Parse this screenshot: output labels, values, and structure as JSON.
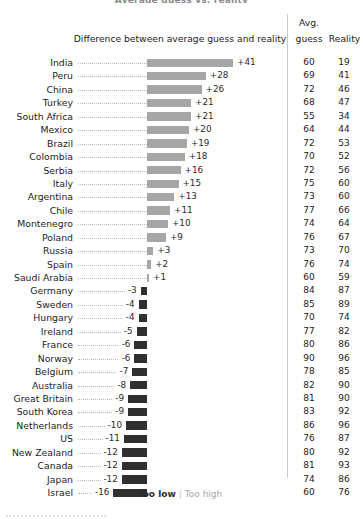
{
  "cropped_title": "Average guess vs. reality",
  "header": {
    "diff_label": "Difference between average guess and reality",
    "avg_line1": "Avg.",
    "avg_line2": "guess",
    "reality_label": "Reality"
  },
  "legend": {
    "too_low": "Too low",
    "separator": "|",
    "too_high": "Too high"
  },
  "colors": {
    "positive_bar": "#a6a6a6",
    "negative_bar": "#2f2f2f",
    "text": "#1c1c1c",
    "leader": "#b9b9b9",
    "divider": "#c9c9c9",
    "too_low": "#2b2b2b",
    "too_high": "#a8a8a8"
  },
  "chart_data": {
    "type": "bar",
    "orientation": "horizontal",
    "title": "Average guess vs. reality",
    "xlabel": "Difference between average guess and reality",
    "ylabel": "",
    "grid": false,
    "legend_position": "bottom",
    "zero_line": 0,
    "xlim": [
      -16,
      41
    ],
    "px_per_unit": 2.1,
    "categories": [
      "India",
      "Peru",
      "China",
      "Turkey",
      "South Africa",
      "Mexico",
      "Brazil",
      "Colombia",
      "Serbia",
      "Italy",
      "Argentina",
      "Chile",
      "Montenegro",
      "Poland",
      "Russia",
      "Spain",
      "Saudi Arabia",
      "Germany",
      "Sweden",
      "Hungary",
      "Ireland",
      "France",
      "Norway",
      "Belgium",
      "Australia",
      "Great Britain",
      "South Korea",
      "Netherlands",
      "US",
      "New Zealand",
      "Canada",
      "Japan",
      "Israel"
    ],
    "series": [
      {
        "name": "Difference between average guess and reality",
        "values": [
          41,
          28,
          26,
          21,
          21,
          20,
          19,
          18,
          16,
          15,
          13,
          11,
          10,
          9,
          3,
          2,
          1,
          -3,
          -4,
          -4,
          -5,
          -6,
          -6,
          -7,
          -8,
          -9,
          -9,
          -10,
          -11,
          -12,
          -12,
          -12,
          -16
        ]
      },
      {
        "name": "Avg. guess",
        "values": [
          60,
          69,
          72,
          68,
          55,
          64,
          72,
          70,
          72,
          75,
          73,
          77,
          74,
          76,
          73,
          76,
          60,
          84,
          85,
          70,
          77,
          80,
          90,
          78,
          82,
          81,
          83,
          86,
          76,
          80,
          81,
          74,
          60
        ]
      },
      {
        "name": "Reality",
        "values": [
          19,
          41,
          46,
          47,
          34,
          44,
          53,
          52,
          56,
          60,
          60,
          66,
          64,
          67,
          70,
          74,
          59,
          87,
          89,
          74,
          82,
          86,
          96,
          85,
          90,
          90,
          92,
          96,
          87,
          92,
          93,
          86,
          76
        ]
      }
    ],
    "value_labels": [
      "+41",
      "+28",
      "+26",
      "+21",
      "+21",
      "+20",
      "+19",
      "+18",
      "+16",
      "+15",
      "+13",
      "+11",
      "+10",
      "+9",
      "+3",
      "+2",
      "+1",
      "-3",
      "-4",
      "-4",
      "-5",
      "-6",
      "-6",
      "-7",
      "-8",
      "-9",
      "-9",
      "-10",
      "-11",
      "-12",
      "-12",
      "-12",
      "-16"
    ]
  }
}
